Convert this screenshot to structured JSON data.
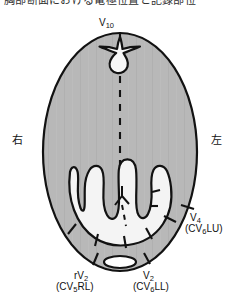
{
  "figure": {
    "name": "thoracic-cross-section-electrode-diagram",
    "truncated_header_text": "胸部断面における電極位置と記録部位",
    "colors": {
      "body_fill": "#b8b8b8",
      "inner_fill": "#f2f2f2",
      "outline": "#121212",
      "background": "#ffffff",
      "text": "#111111"
    },
    "orientation": {
      "right_label": "右",
      "left_label": "左"
    },
    "electrodes": [
      {
        "id": "v10",
        "primary": "V",
        "subscript": "10",
        "alt": "",
        "position": "posterior-midline-top"
      },
      {
        "id": "v4",
        "primary": "V",
        "subscript": "4",
        "alt": "(CV6LU)",
        "alt_primary": "(CV",
        "alt_subscript": "6",
        "alt_suffix": "LU)",
        "position": "left-lateral"
      },
      {
        "id": "rv2",
        "primary": "rV",
        "subscript": "2",
        "alt": "(CV5RL)",
        "alt_primary": "(CV",
        "alt_subscript": "5",
        "alt_suffix": "RL)",
        "position": "right-ventral"
      },
      {
        "id": "v2",
        "primary": "V",
        "subscript": "2",
        "alt": "(CV6LL)",
        "alt_primary": "(CV",
        "alt_subscript": "6",
        "alt_suffix": "LL)",
        "position": "left-ventral"
      }
    ],
    "anatomy": {
      "outer_boundary": "body-wall-ellipse",
      "vertebra": "vertebral-body-with-spinous-process",
      "midline": "dashed-median-plane",
      "lungs": "trident-shaped-lung-lobe-outline",
      "sternum_structure": "bifurcating-white-channel",
      "ventral_oval": "sternum-cross-section-oval"
    }
  }
}
